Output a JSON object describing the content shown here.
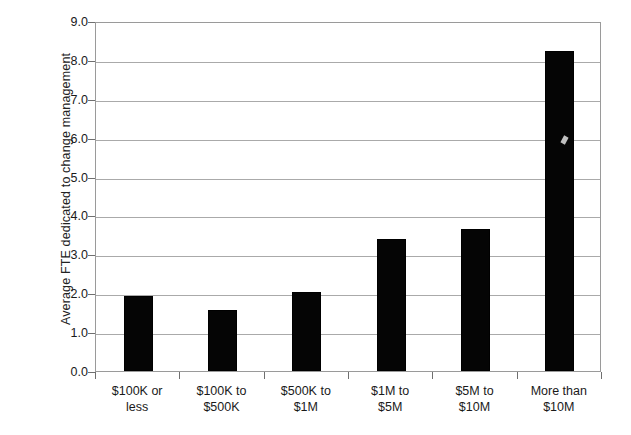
{
  "chart_data": {
    "type": "bar",
    "title": "",
    "xlabel": "",
    "ylabel": "Average FTE dedicated to change management",
    "categories": [
      "$100K or less",
      "$100K to $500K",
      "$500K to $1M",
      "$1M to $5M",
      "$5M to $10M",
      "More than $10M"
    ],
    "category_lines": [
      [
        "$100K or",
        "less"
      ],
      [
        "$100K to",
        "$500K"
      ],
      [
        "$500K to",
        "$1M"
      ],
      [
        "$1M to",
        "$5M"
      ],
      [
        "$5M to",
        "$10M"
      ],
      [
        "More than",
        "$10M"
      ]
    ],
    "values": [
      1.92,
      1.57,
      2.03,
      3.39,
      3.64,
      8.23
    ],
    "ylim": [
      0.0,
      9.0
    ],
    "ytick_step": 1.0,
    "yticks": [
      "0.0",
      "1.0",
      "2.0",
      "3.0",
      "4.0",
      "5.0",
      "6.0",
      "7.0",
      "8.0",
      "9.0"
    ],
    "grid": true,
    "legend": "none",
    "bar_color": "#050505",
    "gridline_color": "#aaaaaa",
    "axis_color": "#9a9a9a",
    "background_color": "#ffffff"
  }
}
